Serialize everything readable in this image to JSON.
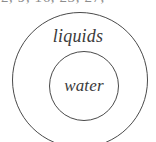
{
  "figure": {
    "type": "euler-diagram",
    "clipped_header": {
      "text": "2, 9, 16, 23, 27,",
      "note": "row of comma separated numbers clipped at the top edge of the image"
    },
    "sets": [
      {
        "id": "outer",
        "label": "liquids",
        "shape": "circle",
        "contains": "water"
      },
      {
        "id": "inner",
        "label": "water",
        "shape": "circle",
        "contains": null
      }
    ],
    "colors": {
      "background": "#ffffff",
      "stroke": "#4a4a4a",
      "label_text": "#3a3a3a",
      "clipped_text": "#8d8d8d"
    }
  },
  "chart_data": {
    "type": "diagram",
    "title": "",
    "categories": [
      "liquids",
      "water"
    ],
    "relation": "water is a proper subset of liquids",
    "annotations": [
      "2, 9, 16, 23, 27,"
    ]
  }
}
